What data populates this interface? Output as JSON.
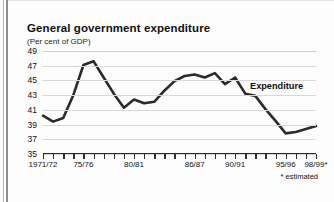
{
  "figure": {
    "title": "General government expenditure",
    "subtitle": "(Per cent of GDP)",
    "footnote": "* estimated"
  },
  "annotations": [
    {
      "name": "series-label-expenditure",
      "text": "Expenditure"
    }
  ],
  "chart_data": {
    "type": "line",
    "title": "General government expenditure",
    "subtitle": "(Per cent of GDP)",
    "xlabel": "",
    "ylabel": "Per cent of GDP",
    "ylim": [
      35,
      49
    ],
    "yticks": [
      35,
      37,
      39,
      41,
      43,
      45,
      47,
      49
    ],
    "ytick_labels": [
      "35",
      "37",
      "39",
      "41",
      "43",
      "45",
      "47",
      "49"
    ],
    "grid": true,
    "grid_axis": "y",
    "legend": "inline-annotation",
    "legend_position": "right",
    "line_color": "#2b2b2b",
    "line_width": 2.6,
    "x": [
      "1971/72",
      "72/73",
      "73/74",
      "74/75",
      "75/76",
      "76/77",
      "77/78",
      "78/79",
      "79/80",
      "80/81",
      "81/82",
      "82/83",
      "83/84",
      "84/85",
      "85/86",
      "86/87",
      "87/88",
      "88/89",
      "89/90",
      "90/91",
      "91/92",
      "92/93",
      "93/94",
      "94/95",
      "95/96",
      "96/97",
      "97/98",
      "98/99*"
    ],
    "x_tick_labels_shown": [
      {
        "index": 0,
        "label": "1971/72"
      },
      {
        "index": 4,
        "label": "75/76"
      },
      {
        "index": 9,
        "label": "80/81"
      },
      {
        "index": 15,
        "label": "86/87"
      },
      {
        "index": 19,
        "label": "90/91"
      },
      {
        "index": 24,
        "label": "95/96"
      },
      {
        "index": 27,
        "label": "98/99*"
      }
    ],
    "series": [
      {
        "name": "Expenditure",
        "values": [
          40.2,
          39.4,
          39.9,
          43.0,
          47.1,
          47.6,
          45.4,
          43.2,
          41.3,
          42.4,
          41.9,
          42.1,
          43.6,
          44.9,
          45.6,
          45.8,
          45.4,
          46.0,
          44.5,
          45.4,
          43.2,
          42.9,
          41.1,
          39.5,
          37.8,
          38.0,
          38.4,
          38.8
        ]
      }
    ]
  }
}
